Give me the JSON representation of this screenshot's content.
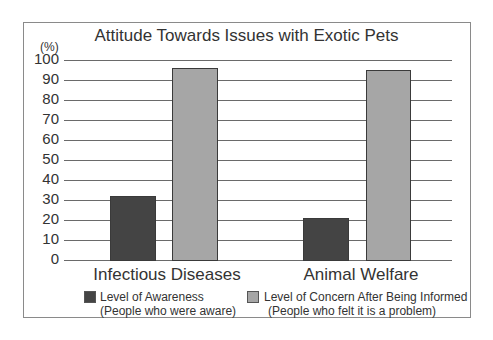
{
  "chart_data": {
    "type": "bar",
    "title": "Attitude Towards Issues with Exotic Pets",
    "ylabel": "(%)",
    "xlabel": "",
    "ylim": [
      0,
      100
    ],
    "yticks": [
      0,
      10,
      20,
      30,
      40,
      50,
      60,
      70,
      80,
      90,
      100
    ],
    "grid": true,
    "legend_position": "bottom",
    "categories": [
      "Infectious Diseases",
      "Animal Welfare"
    ],
    "series": [
      {
        "name": "Level of Awareness (People who were aware)",
        "label_line1": "Level of Awareness",
        "label_line2": "(People who were aware)",
        "color": "#444444",
        "values": [
          32,
          21
        ]
      },
      {
        "name": "Level of Concern After Being Informed (People who felt it is a problem)",
        "label_line1": "Level of Concern After Being Informed",
        "label_line2": "(People who felt it is a problem)",
        "color": "#a6a6a6",
        "values": [
          96,
          95
        ]
      }
    ]
  }
}
